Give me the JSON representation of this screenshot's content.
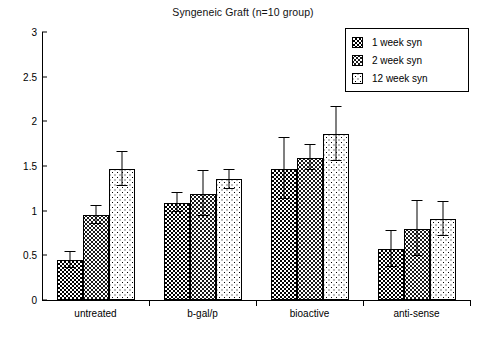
{
  "chart_data": {
    "type": "bar",
    "title": "Syngeneic Graft (n=10 group)",
    "xlabel": "",
    "ylabel": "",
    "ylim": [
      0,
      3
    ],
    "yticks": [
      "0",
      "0.5",
      "1",
      "1.5",
      "2",
      "2.5",
      "3"
    ],
    "ytick_values": [
      0,
      0.5,
      1,
      1.5,
      2,
      2.5,
      3
    ],
    "grid": false,
    "legend_position": "top-right",
    "categories": [
      "untreated",
      "b-gal/p",
      "bioactive",
      "anti-sense"
    ],
    "series": [
      {
        "name": "1 week syn",
        "pattern": "medium-checkerboard",
        "values": [
          0.45,
          1.09,
          1.47,
          0.57
        ],
        "errors": [
          0.09,
          0.11,
          0.34,
          0.2
        ]
      },
      {
        "name": "2 week syn",
        "pattern": "dark-checker",
        "values": [
          0.95,
          1.19,
          1.59,
          0.8
        ],
        "errors": [
          0.1,
          0.25,
          0.14,
          0.31
        ]
      },
      {
        "name": "12 week syn",
        "pattern": "light-dots",
        "values": [
          1.47,
          1.35,
          1.86,
          0.91
        ],
        "errors": [
          0.19,
          0.11,
          0.3,
          0.19
        ]
      }
    ]
  },
  "legend": {
    "items": [
      {
        "label": "1 week syn"
      },
      {
        "label": "2 week syn"
      },
      {
        "label": "12 week syn"
      }
    ]
  },
  "colors": {
    "axis": "#000000",
    "text": "#000000",
    "background": "#ffffff",
    "series_1": "#000000",
    "series_2": "#1a1a1a",
    "series_3": "#ffffff"
  }
}
